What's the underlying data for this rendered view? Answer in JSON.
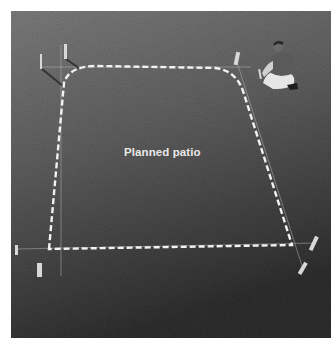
{
  "figure": {
    "label": "Planned patio",
    "colors": {
      "background": "#ffffff",
      "grass_light": "#7a7a7a",
      "grass_dark": "#333333",
      "outline": "#f2f2f2",
      "stake": "#d8d8d8",
      "string": "#bdbdbd"
    }
  }
}
